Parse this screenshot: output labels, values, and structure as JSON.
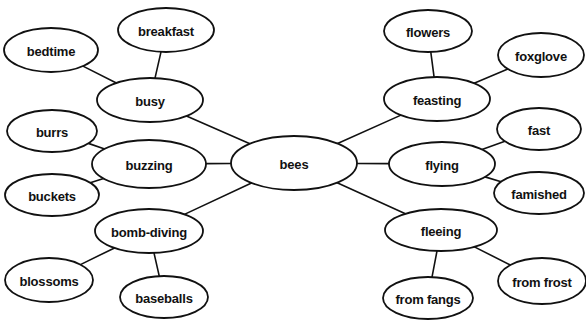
{
  "diagram": {
    "type": "concept-map",
    "title": "bees",
    "background_color": "#ffffff",
    "node_fill": "#ffffff",
    "node_stroke": "#111111",
    "edge_color": "#111111",
    "width": 586,
    "height": 320,
    "nodes": [
      {
        "id": "bees",
        "label": "bees",
        "level": "center",
        "cx": 294,
        "cy": 163,
        "rx": 63,
        "ry": 27
      },
      {
        "id": "busy",
        "label": "busy",
        "level": "branch",
        "cx": 150,
        "cy": 100,
        "rx": 53,
        "ry": 22
      },
      {
        "id": "buzzing",
        "label": "buzzing",
        "level": "branch",
        "cx": 149,
        "cy": 164,
        "rx": 57,
        "ry": 24
      },
      {
        "id": "bombdiving",
        "label": "bomb-diving",
        "level": "branch",
        "cx": 149,
        "cy": 231,
        "rx": 54,
        "ry": 22
      },
      {
        "id": "feasting",
        "label": "feasting",
        "level": "branch",
        "cx": 437,
        "cy": 99,
        "rx": 53,
        "ry": 22
      },
      {
        "id": "flying",
        "label": "flying",
        "level": "branch",
        "cx": 442,
        "cy": 164,
        "rx": 53,
        "ry": 22
      },
      {
        "id": "fleeing",
        "label": "fleeing",
        "level": "branch",
        "cx": 441,
        "cy": 230,
        "rx": 56,
        "ry": 21
      },
      {
        "id": "bedtime",
        "label": "bedtime",
        "level": "leaf",
        "cx": 51,
        "cy": 50,
        "rx": 47,
        "ry": 22
      },
      {
        "id": "breakfast",
        "label": "breakfast",
        "level": "leaf",
        "cx": 166,
        "cy": 30,
        "rx": 48,
        "ry": 22
      },
      {
        "id": "burrs",
        "label": "burrs",
        "level": "leaf",
        "cx": 52,
        "cy": 131,
        "rx": 45,
        "ry": 21
      },
      {
        "id": "buckets",
        "label": "buckets",
        "level": "leaf",
        "cx": 52,
        "cy": 195,
        "rx": 47,
        "ry": 21
      },
      {
        "id": "blossoms",
        "label": "blossoms",
        "level": "leaf",
        "cx": 49,
        "cy": 280,
        "rx": 44,
        "ry": 22
      },
      {
        "id": "baseballs",
        "label": "baseballs",
        "level": "leaf",
        "cx": 164,
        "cy": 297,
        "rx": 44,
        "ry": 21
      },
      {
        "id": "flowers",
        "label": "flowers",
        "level": "leaf",
        "cx": 428,
        "cy": 31,
        "rx": 44,
        "ry": 21
      },
      {
        "id": "foxglove",
        "label": "foxglove",
        "level": "leaf",
        "cx": 541,
        "cy": 55,
        "rx": 43,
        "ry": 22
      },
      {
        "id": "fast",
        "label": "fast",
        "level": "leaf",
        "cx": 539,
        "cy": 129,
        "rx": 42,
        "ry": 21
      },
      {
        "id": "famished",
        "label": "famished",
        "level": "leaf",
        "cx": 539,
        "cy": 193,
        "rx": 45,
        "ry": 21
      },
      {
        "id": "fromfangs",
        "label": "from fangs",
        "level": "leaf",
        "cx": 428,
        "cy": 298,
        "rx": 45,
        "ry": 21
      },
      {
        "id": "fromfrost",
        "label": "from frost",
        "level": "leaf",
        "cx": 542,
        "cy": 281,
        "rx": 44,
        "ry": 23
      }
    ],
    "edges": [
      {
        "from": "bees",
        "to": "busy"
      },
      {
        "from": "bees",
        "to": "buzzing"
      },
      {
        "from": "bees",
        "to": "bombdiving"
      },
      {
        "from": "bees",
        "to": "feasting"
      },
      {
        "from": "bees",
        "to": "flying"
      },
      {
        "from": "bees",
        "to": "fleeing"
      },
      {
        "from": "busy",
        "to": "bedtime"
      },
      {
        "from": "busy",
        "to": "breakfast"
      },
      {
        "from": "buzzing",
        "to": "burrs"
      },
      {
        "from": "buzzing",
        "to": "buckets"
      },
      {
        "from": "bombdiving",
        "to": "blossoms"
      },
      {
        "from": "bombdiving",
        "to": "baseballs"
      },
      {
        "from": "feasting",
        "to": "flowers"
      },
      {
        "from": "feasting",
        "to": "foxglove"
      },
      {
        "from": "flying",
        "to": "fast"
      },
      {
        "from": "flying",
        "to": "famished"
      },
      {
        "from": "fleeing",
        "to": "fromfangs"
      },
      {
        "from": "fleeing",
        "to": "fromfrost"
      }
    ]
  }
}
